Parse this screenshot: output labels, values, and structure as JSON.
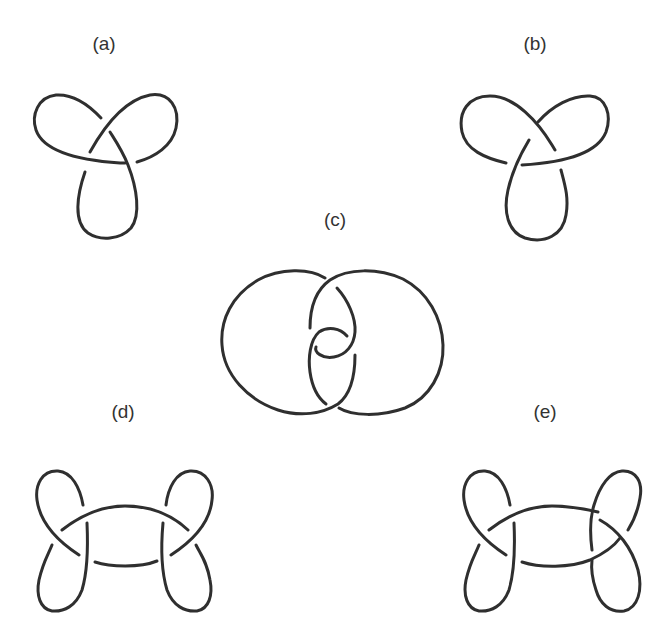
{
  "figure": {
    "stroke_color": "#2f2f2f",
    "background_color": "#ffffff",
    "panels": [
      {
        "id": "a",
        "label": "(a)",
        "kind": "left-handed trefoil diagram"
      },
      {
        "id": "b",
        "label": "(b)",
        "kind": "right-handed trefoil diagram"
      },
      {
        "id": "c",
        "label": "(c)",
        "kind": "two-lobed knot diagram with central twist"
      },
      {
        "id": "d",
        "label": "(d)",
        "kind": "double-loop knot diagram"
      },
      {
        "id": "e",
        "label": "(e)",
        "kind": "double-loop knot diagram (alternate crossing)"
      }
    ]
  }
}
